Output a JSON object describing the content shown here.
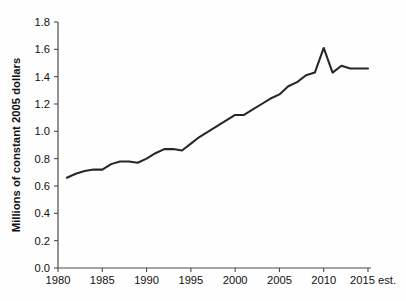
{
  "chart_data": {
    "type": "line",
    "title": "",
    "xlabel": "",
    "ylabel": "Millions of constant 2005 dollars",
    "xlim": [
      1980,
      2015
    ],
    "ylim": [
      0.0,
      1.8
    ],
    "grid": false,
    "legend": null,
    "x_ticks": [
      "1980",
      "1985",
      "1990",
      "1995",
      "2000",
      "2005",
      "2010",
      "2015 est."
    ],
    "x_tick_values": [
      1980,
      1985,
      1990,
      1995,
      2000,
      2005,
      2010,
      2015
    ],
    "y_ticks": [
      "0.0",
      "0.2",
      "0.4",
      "0.6",
      "0.8",
      "1.0",
      "1.2",
      "1.4",
      "1.6",
      "1.8"
    ],
    "y_tick_values": [
      0.0,
      0.2,
      0.4,
      0.6,
      0.8,
      1.0,
      1.2,
      1.4,
      1.6,
      1.8
    ],
    "series": [
      {
        "name": "Millions of constant 2005 dollars",
        "color": "#272727",
        "x": [
          1981,
          1982,
          1983,
          1984,
          1985,
          1986,
          1987,
          1988,
          1989,
          1990,
          1991,
          1992,
          1993,
          1994,
          1995,
          1996,
          1997,
          1998,
          1999,
          2000,
          2001,
          2002,
          2003,
          2004,
          2005,
          2006,
          2007,
          2008,
          2009,
          2010,
          2011,
          2012,
          2013,
          2014,
          2015
        ],
        "values": [
          0.66,
          0.69,
          0.71,
          0.72,
          0.72,
          0.76,
          0.78,
          0.78,
          0.77,
          0.8,
          0.84,
          0.87,
          0.87,
          0.86,
          0.91,
          0.96,
          1.0,
          1.04,
          1.08,
          1.12,
          1.12,
          1.16,
          1.2,
          1.24,
          1.27,
          1.33,
          1.36,
          1.41,
          1.43,
          1.61,
          1.43,
          1.48,
          1.46,
          1.46,
          1.46
        ]
      }
    ]
  },
  "axes": {
    "y_axis_title": "Millions of constant 2005 dollars"
  }
}
